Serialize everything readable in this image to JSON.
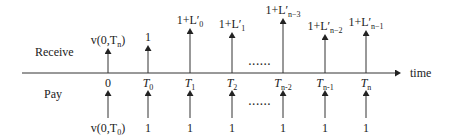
{
  "diagram": {
    "type": "cash-flow timeline",
    "axis_label": "time",
    "row_labels": {
      "receive": "Receive",
      "pay": "Pay"
    },
    "ellipsis": "......",
    "ticks": [
      {
        "id": "t0",
        "label": "0",
        "x": 108
      },
      {
        "id": "T0",
        "label": "T",
        "sub": "0",
        "x": 148
      },
      {
        "id": "T1",
        "label": "T",
        "sub": "1",
        "x": 190
      },
      {
        "id": "T2",
        "label": "T",
        "sub": "2",
        "x": 232
      },
      {
        "id": "Tn2",
        "label": "T",
        "sub": "n-2",
        "x": 283
      },
      {
        "id": "Tn1",
        "label": "T",
        "sub": "n-1",
        "x": 325
      },
      {
        "id": "Tn",
        "label": "T",
        "sub": "n",
        "x": 366
      }
    ],
    "receive_flows": [
      {
        "x": 108,
        "top": 48,
        "label": "v(0,T",
        "label_sub": "n",
        "label_end": ")"
      },
      {
        "x": 148,
        "top": 45,
        "label": "1"
      },
      {
        "x": 190,
        "top": 28,
        "label": "1+L′",
        "label_sub": "0"
      },
      {
        "x": 232,
        "top": 32,
        "label": "1+L′",
        "label_sub": "1"
      },
      {
        "x": 283,
        "top": 18,
        "label": "1+L′",
        "label_sub": "n−3"
      },
      {
        "x": 325,
        "top": 34,
        "label": "1+L′",
        "label_sub": "n−2"
      },
      {
        "x": 366,
        "top": 30,
        "label": "1+L′",
        "label_sub": "n−1"
      }
    ],
    "pay_flows": [
      {
        "x": 108,
        "label": "v(0,T",
        "label_sub": "0",
        "label_end": ")"
      },
      {
        "x": 148,
        "label": "1"
      },
      {
        "x": 190,
        "label": "1"
      },
      {
        "x": 232,
        "label": "1"
      },
      {
        "x": 283,
        "label": "1"
      },
      {
        "x": 325,
        "label": "1"
      },
      {
        "x": 366,
        "label": "1"
      }
    ],
    "colors": {
      "line": "#333333",
      "text": "#222222"
    }
  }
}
